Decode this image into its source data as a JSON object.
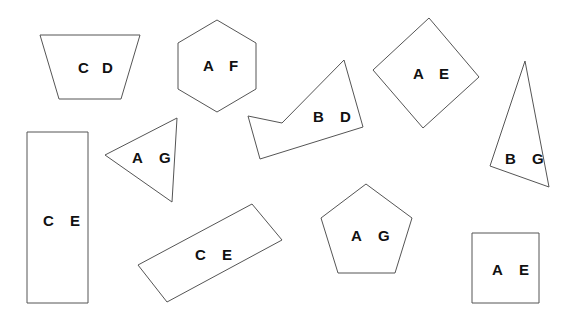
{
  "shapes": [
    {
      "name": "trapezoid",
      "type": "trapezoid",
      "points": "40,35 140,35 121,99 59,99",
      "labels": [
        "C",
        "D"
      ],
      "label_pos": [
        [
          78,
          73
        ],
        [
          102,
          73
        ]
      ]
    },
    {
      "name": "hexagon",
      "type": "hexagon",
      "points": "217,20 256,43 256,89 217,112 178,89 178,43",
      "labels": [
        "A",
        "F"
      ],
      "label_pos": [
        [
          203,
          71
        ],
        [
          229,
          71
        ]
      ]
    },
    {
      "name": "irregular-pentagon",
      "type": "irregular-polygon",
      "points": "248,116 282,123 344,60 363,127 260,159",
      "labels": [
        "B",
        "D"
      ],
      "label_pos": [
        [
          313,
          122
        ],
        [
          340,
          122
        ]
      ]
    },
    {
      "name": "diamond",
      "type": "rotated-square",
      "points": "429,18 479,77 423,128 373,70",
      "labels": [
        "A",
        "E"
      ],
      "label_pos": [
        [
          413,
          79
        ],
        [
          439,
          79
        ]
      ]
    },
    {
      "name": "tall-triangle",
      "type": "triangle",
      "points": "525,61 549,187 490,166",
      "labels": [
        "B",
        "G"
      ],
      "label_pos": [
        [
          505,
          164
        ],
        [
          532,
          164
        ]
      ]
    },
    {
      "name": "tall-rectangle",
      "type": "rectangle",
      "points": "27,132 88,132 88,303 27,303",
      "labels": [
        "C",
        "E"
      ],
      "label_pos": [
        [
          43,
          226
        ],
        [
          70,
          226
        ]
      ]
    },
    {
      "name": "triangle",
      "type": "triangle",
      "points": "105,155 177,118 172,202",
      "labels": [
        "A",
        "G"
      ],
      "label_pos": [
        [
          132,
          163
        ],
        [
          159,
          163
        ]
      ]
    },
    {
      "name": "slanted-rectangle",
      "type": "rotated-rectangle",
      "points": "138,265 252,204 282,240 167,302",
      "labels": [
        "C",
        "E"
      ],
      "label_pos": [
        [
          195,
          260
        ],
        [
          222,
          260
        ]
      ]
    },
    {
      "name": "pentagon",
      "type": "pentagon",
      "points": "366,184 412,218 395,273 338,273 321,218",
      "labels": [
        "A",
        "G"
      ],
      "label_pos": [
        [
          351,
          241
        ],
        [
          378,
          241
        ]
      ]
    },
    {
      "name": "square",
      "type": "square",
      "points": "472,233 539,233 539,303 472,303",
      "labels": [
        "A",
        "E"
      ],
      "label_pos": [
        [
          492,
          275
        ],
        [
          519,
          275
        ]
      ]
    }
  ]
}
